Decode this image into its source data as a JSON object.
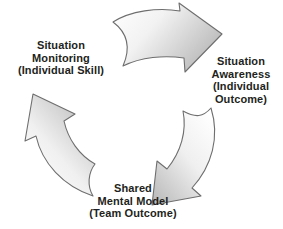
{
  "diagram": {
    "type": "cycle",
    "direction": "clockwise",
    "background_color": "#ffffff",
    "text_color": "#231f20",
    "arrow_fill_light": "#fcfcfc",
    "arrow_fill_dark": "#bdbdbd",
    "arrow_outline": "#6e6e6e",
    "nodes": [
      {
        "id": "situation-monitoring",
        "lines": [
          "Situation",
          "Monitoring",
          "(Individual Skill)"
        ],
        "position": "left"
      },
      {
        "id": "situation-awareness",
        "lines": [
          "Situation",
          "Awareness",
          "(Individual",
          "Outcome)"
        ],
        "position": "right"
      },
      {
        "id": "shared-mental-model",
        "lines": [
          "Shared",
          "Mental Model",
          "(Team Outcome)"
        ],
        "position": "bottom"
      }
    ],
    "arrows": [
      {
        "id": "arrow-top",
        "from": "situation-monitoring",
        "to": "situation-awareness",
        "name": "curved-arrow-top-right"
      },
      {
        "id": "arrow-right",
        "from": "situation-awareness",
        "to": "shared-mental-model",
        "name": "curved-arrow-down-left"
      },
      {
        "id": "arrow-left",
        "from": "shared-mental-model",
        "to": "situation-monitoring",
        "name": "curved-arrow-up-right"
      }
    ]
  }
}
